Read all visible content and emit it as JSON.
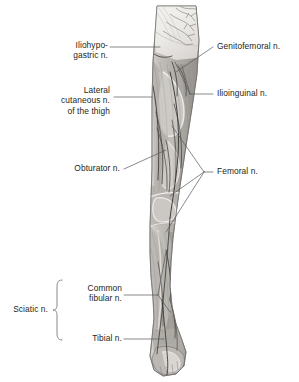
{
  "figure": {
    "background_color": "#ffffff",
    "ink_color": "#231f20",
    "leader_color": "#58585a",
    "tissue_tones": {
      "skin_light": "#e9e7e4",
      "muscle_mid": "#b9b6b1",
      "muscle_dark": "#8e8b87",
      "fascia_pale": "#f2f1ef",
      "nerve_line": "#4c4a49",
      "outline": "#6f6d6b"
    }
  },
  "labels": {
    "iliohypogastric": "Iliohypo-\ngastric n.",
    "lateral_cutaneous": "Lateral\ncutaneous n.\nof the thigh",
    "obturator": "Obturator n.",
    "genitofemoral": "Genitofemoral n.",
    "ilioinguinal": "Ilioinguinal n.",
    "femoral": "Femoral n.",
    "common_fibular": "Common\nfibular n.",
    "tibial": "Tibial n.",
    "sciatic": "Sciatic n."
  }
}
